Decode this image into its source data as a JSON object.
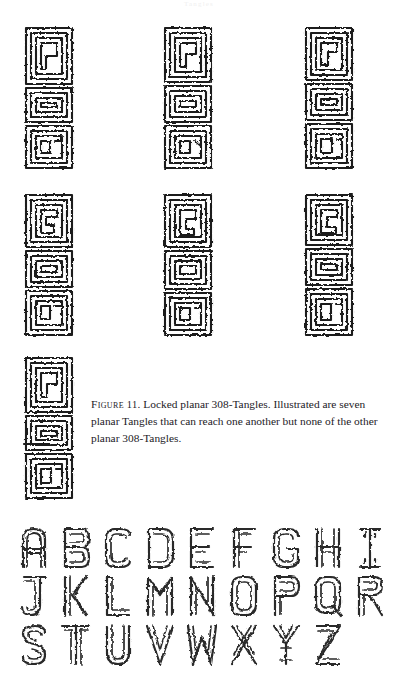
{
  "page": {
    "background_color": "#ffffff",
    "ink_color": "#1b1b1b",
    "running_header": "Tangles"
  },
  "figure": {
    "name": "locked-planar-308-tangles",
    "count": 7,
    "rows": [
      3,
      3,
      1
    ],
    "tangle_labels": [
      "tangle-1",
      "tangle-2",
      "tangle-3",
      "tangle-4",
      "tangle-5",
      "tangle-6",
      "tangle-7"
    ]
  },
  "caption": {
    "label": "Figure",
    "number": "11",
    "separator": ".",
    "text": " Locked planar 308-Tangles. Illustrated are seven planar Tangles that can reach one another but none of the other planar 308-Tangles."
  },
  "alphabet": {
    "title": "knot-alphabet-specimen",
    "rows": [
      [
        "A",
        "B",
        "C",
        "D",
        "E",
        "F",
        "G",
        "H",
        "I"
      ],
      [
        "J",
        "K",
        "L",
        "M",
        "N",
        "O",
        "P",
        "Q",
        "R"
      ],
      [
        "S",
        "T",
        "U",
        "V",
        "W",
        "X",
        "Y",
        "Z"
      ]
    ]
  }
}
